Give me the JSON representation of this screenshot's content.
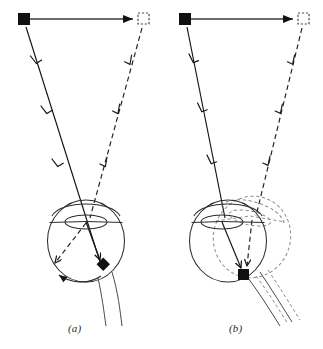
{
  "figure": {
    "background_color": "#ffffff",
    "ink_color": "#1a1a1a",
    "width": 323,
    "height": 349,
    "panel_labels": [
      {
        "id": "a",
        "text": "(a)",
        "x": 68,
        "y": 322
      },
      {
        "id": "b",
        "text": "(b)",
        "x": 229,
        "y": 322
      }
    ]
  },
  "panels": [
    {
      "id": "a",
      "label": "(a)",
      "description": "Eye does not rotate: the target image moves across the retina",
      "stimulus": {
        "start_marker": {
          "type": "filled-square",
          "x": 24,
          "y": 19,
          "size": 12,
          "fill": "#111111"
        },
        "end_marker": {
          "type": "dashed-open-square",
          "x": 143,
          "y": 19,
          "size": 11,
          "stroke": "#444444"
        },
        "motion_arrow": {
          "from_x": 30,
          "from_y": 19,
          "to_x": 136,
          "to_y": 19,
          "style": "solid",
          "head": "filled"
        }
      },
      "rays": [
        {
          "name": "initial-ray",
          "style": "solid",
          "from_x": 26,
          "from_y": 26,
          "to_x": 103,
          "to_y": 264,
          "chevron_count": 3
        },
        {
          "name": "displaced-ray",
          "style": "dashed",
          "from_x": 142,
          "from_y": 27,
          "to_x": 52,
          "to_y": 266,
          "chevron_count": 3
        }
      ],
      "eye": {
        "globe": {
          "cx": 86,
          "cy": 241,
          "rx": 39,
          "ry": 41,
          "style": "solid"
        },
        "lens": {
          "cx": 86,
          "cy": 221,
          "rx": 21,
          "ry": 7,
          "style": "solid"
        },
        "optic_nerve": {
          "style": "solid",
          "direction": "down-right"
        },
        "rotated_copy": false
      },
      "image_points": [
        {
          "name": "foveal-image",
          "type": "filled-diamond",
          "x": 103,
          "y": 264,
          "fill": "#111111"
        },
        {
          "name": "displaced-image",
          "type": "dashed-arrow-tip",
          "x": 52,
          "y": 266
        }
      ],
      "rotation_arc": {
        "present": true,
        "from_x": 100,
        "from_y": 276,
        "to_x": 56,
        "to_y": 272,
        "head": "filled"
      }
    },
    {
      "id": "b",
      "label": "(b)",
      "description": "Eye rotates with the target: the image stays on the same retinal point",
      "stimulus": {
        "start_marker": {
          "type": "filled-square",
          "x": 185,
          "y": 19,
          "size": 12,
          "fill": "#111111"
        },
        "end_marker": {
          "type": "dashed-open-square",
          "x": 303,
          "y": 19,
          "size": 11,
          "stroke": "#444444"
        },
        "motion_arrow": {
          "from_x": 191,
          "from_y": 19,
          "to_x": 296,
          "to_y": 19,
          "style": "solid",
          "head": "filled"
        }
      },
      "rays": [
        {
          "name": "initial-ray",
          "style": "solid",
          "from_x": 187,
          "from_y": 26,
          "to_x": 243,
          "to_y": 272,
          "chevron_count": 3
        },
        {
          "name": "displaced-ray",
          "style": "dashed",
          "from_x": 302,
          "from_y": 27,
          "to_x": 248,
          "to_y": 272,
          "chevron_count": 3
        }
      ],
      "eye": {
        "globe": {
          "cx": 228,
          "cy": 241,
          "rx": 39,
          "ry": 41,
          "style": "solid"
        },
        "lens": {
          "cx": 222,
          "cy": 223,
          "rx": 21,
          "ry": 7,
          "style": "solid"
        },
        "optic_nerve": {
          "style": "solid",
          "direction": "down-right"
        },
        "rotated_copy": true,
        "rotated_globe": {
          "cx": 252,
          "cy": 237,
          "rx": 39,
          "ry": 41,
          "style": "dashed",
          "rotation_deg": 18
        },
        "rotated_lens": {
          "cx": 249,
          "cy": 218,
          "rx": 21,
          "ry": 7,
          "style": "dashed"
        },
        "rotated_optic_nerve": {
          "style": "dashed",
          "direction": "down-right"
        }
      },
      "image_points": [
        {
          "name": "foveal-image",
          "type": "filled-square",
          "x": 243,
          "y": 274,
          "size": 10,
          "fill": "#111111"
        }
      ],
      "rotation_arc": {
        "present": false
      }
    }
  ]
}
